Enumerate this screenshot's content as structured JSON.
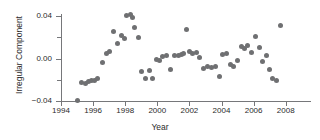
{
  "chart_data": {
    "type": "scatter",
    "title": "",
    "xlabel": "Year",
    "ylabel": "Irregular Component",
    "xlim": [
      1993.6,
      2008.8
    ],
    "ylim": [
      -0.04,
      0.045
    ],
    "grid": false,
    "legend": null,
    "marker_color": "#6f7072",
    "xticks": [
      1994,
      1996,
      1998,
      2000,
      2002,
      2004,
      2006,
      2008
    ],
    "xtick_labels": [
      "1994",
      "1996",
      "1998",
      "2000",
      "2002",
      "2004",
      "2006",
      "2008"
    ],
    "yticks": [
      -0.04,
      -0.02,
      0.0,
      0.02,
      0.04
    ],
    "ytick_labels": [
      "-0.04",
      "",
      "0.00",
      "",
      "0.04"
    ],
    "ytick_labels_major": [
      "0.04",
      "0.00",
      "-0.04"
    ],
    "series": [
      {
        "name": "Irregular Component",
        "x": [
          1995.0,
          1995.3,
          1995.5,
          1995.7,
          1995.9,
          1996.1,
          1996.3,
          1996.6,
          1996.85,
          1997.05,
          1997.3,
          1997.5,
          1997.75,
          1997.95,
          1998.1,
          1998.3,
          1998.45,
          1998.6,
          1998.8,
          1999.0,
          1999.25,
          1999.5,
          1999.7,
          1999.95,
          2000.15,
          2000.35,
          2000.6,
          2000.85,
          2001.1,
          2001.3,
          2001.5,
          2001.65,
          2001.85,
          2002.0,
          2002.2,
          2002.45,
          2002.65,
          2002.9,
          2003.15,
          2003.4,
          2003.6,
          2003.85,
          2004.05,
          2004.3,
          2004.55,
          2004.75,
          2005.0,
          2005.25,
          2005.45,
          2005.65,
          2005.9,
          2006.1,
          2006.35,
          2006.55,
          2006.8,
          2007.0,
          2007.2,
          2007.45,
          2007.65
        ],
        "y": [
          -0.0395,
          -0.0225,
          -0.0235,
          -0.0215,
          -0.0205,
          -0.0205,
          -0.0185,
          -0.0035,
          0.0045,
          0.0065,
          0.0255,
          0.0145,
          0.0215,
          0.0185,
          0.0405,
          0.0415,
          0.0385,
          0.0295,
          0.0195,
          -0.0125,
          -0.0185,
          -0.0115,
          -0.0185,
          -0.0005,
          -0.0015,
          0.0015,
          0.0025,
          -0.0105,
          0.0025,
          0.0025,
          0.0035,
          0.0045,
          0.0275,
          0.0065,
          0.0045,
          0.0055,
          0.0005,
          -0.0095,
          -0.0075,
          -0.0085,
          -0.0075,
          -0.0165,
          0.0035,
          0.0045,
          -0.0055,
          -0.0075,
          -0.0015,
          0.0115,
          0.0095,
          0.0125,
          0.0055,
          0.0205,
          0.0105,
          -0.0025,
          0.0025,
          -0.0105,
          -0.0185,
          -0.0205,
          0.0315
        ]
      }
    ]
  }
}
